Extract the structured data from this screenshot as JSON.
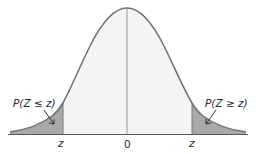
{
  "diagram": {
    "labels": {
      "left_tail": "P(Z ≤ z)",
      "right_tail": "P(Z ≥ z)",
      "left_z": "z",
      "center": "0",
      "right_z": "z"
    },
    "colors": {
      "curve": "#6e6e6e",
      "tail_fill": "#a9a9a9",
      "center_fill": "#f4f4f4",
      "axis": "#555555",
      "center_line": "#9a9a9a",
      "text": "#2b2b2b"
    }
  }
}
